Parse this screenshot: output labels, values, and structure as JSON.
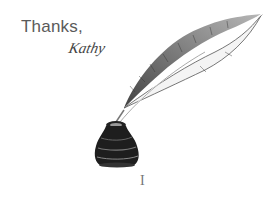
{
  "message": {
    "greeting": "Thanks,",
    "signature": "Kathy"
  },
  "illustration": {
    "subject": "quill-feather-in-inkwell",
    "ink_color": "#1a1a1a"
  },
  "cursor": {
    "glyph": "I"
  }
}
